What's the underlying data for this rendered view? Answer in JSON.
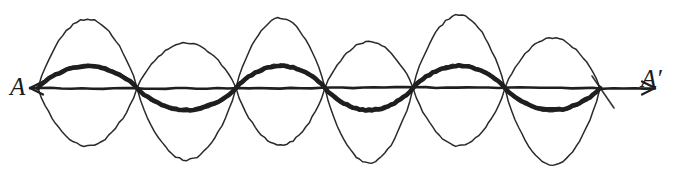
{
  "figure": {
    "kind": "hand-drawn-diagram",
    "background_color": "#ffffff",
    "ink_color": "#1f1f1f",
    "width": 673,
    "height": 176
  },
  "labels": {
    "left_axis_label": "A",
    "right_axis_label": "A′"
  },
  "chart_data": {
    "type": "line",
    "title": "",
    "subtitle": "",
    "xlabel": "",
    "ylabel": "",
    "grid": false,
    "legend_position": "none",
    "axis": {
      "name": "A-A'",
      "baseline_y": 88,
      "x_start": 30,
      "x_end": 655,
      "left_arrowhead": true,
      "right_arrowhead": true,
      "stroke_width": 2.6,
      "start_label": "A",
      "end_label": "A′"
    },
    "nodes_x": [
      38,
      137,
      236,
      325,
      413,
      505,
      600
    ],
    "series": [
      {
        "name": "higher-harmonic-thin",
        "style": "thin",
        "stroke_width": 1.5,
        "color": "#1f1f1f",
        "loops": 6,
        "description": "large-amplitude six-loop mode drawn as closed lens-shaped loops above and below the axis",
        "loop_extents_top": [
          19,
          43,
          18,
          42,
          15,
          38
        ],
        "loop_extents_bottom": [
          146,
          160,
          145,
          163,
          146,
          165
        ]
      },
      {
        "name": "fundamental-thick",
        "style": "thick",
        "stroke_width": 4.6,
        "color": "#1f1f1f",
        "loops": 6,
        "amplitude": 22,
        "description": "smaller-amplitude wave alternating above and below the axis between the same nodes",
        "signs": [
          -1,
          1,
          -1,
          1,
          -1,
          1
        ]
      }
    ],
    "xlim": [
      0,
      673
    ],
    "ylim": [
      0,
      176
    ]
  }
}
